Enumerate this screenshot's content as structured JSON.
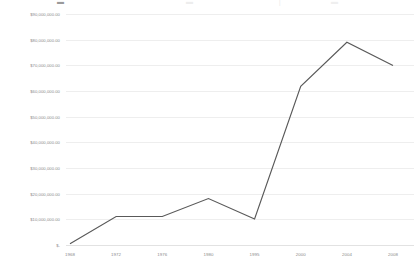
{
  "top_strip": {
    "clipped_text": "",
    "note": ""
  },
  "chart_data": {
    "type": "line",
    "title": "",
    "subtitle": "",
    "xlabel": "",
    "ylabel": "",
    "categories": [
      "1968",
      "1972",
      "1976",
      "1980",
      "1995",
      "2000",
      "2004",
      "2008"
    ],
    "series": [
      {
        "name": "Amount",
        "color": "#595959",
        "values": [
          700000,
          11300000,
          11300000,
          18300000,
          10300000,
          62000000,
          79200000,
          70100000
        ]
      }
    ],
    "values": [
      700000,
      11300000,
      11300000,
      18300000,
      10300000,
      62000000,
      79200000,
      70100000
    ],
    "ylim": [
      0,
      90000000
    ],
    "ytick_values": [
      0,
      10000000,
      20000000,
      30000000,
      40000000,
      50000000,
      60000000,
      70000000,
      80000000,
      90000000
    ],
    "ytick_labels": [
      "$-",
      "$10,000,000.00",
      "$20,000,000.00",
      "$30,000,000.00",
      "$40,000,000.00",
      "$50,000,000.00",
      "$60,000,000.00",
      "$70,000,000.00",
      "$80,000,000.00",
      "$90,000,000.00"
    ],
    "xtick_labels": [
      "1968",
      "1972",
      "1976",
      "1980",
      "1995",
      "2000",
      "2004",
      "2008"
    ],
    "grid": {
      "horizontal": true,
      "vertical": false,
      "color": "#e2e2e2"
    },
    "legend": {
      "visible": false,
      "position": "none",
      "entries": []
    },
    "markers": false,
    "background": "#ffffff",
    "line_color": "#595959"
  }
}
